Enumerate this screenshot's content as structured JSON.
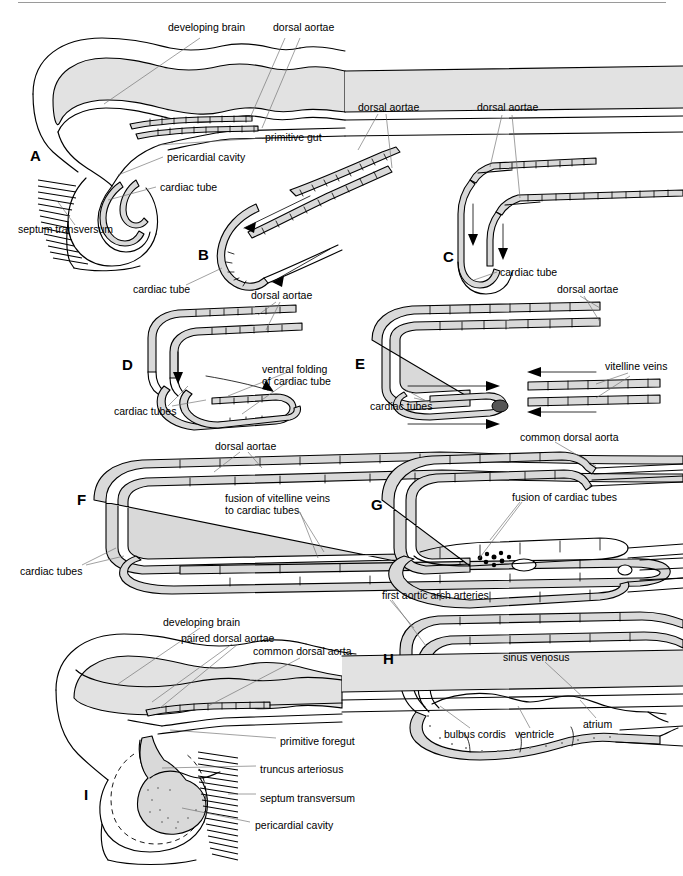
{
  "figure": {
    "width": 683,
    "height": 876,
    "background": "#ffffff",
    "ink_color": "#000000",
    "fill_gray": "#e2e2e2",
    "leader_color": "#6d6d6d"
  },
  "panels": [
    {
      "id": "A",
      "letter": "A",
      "letter_pos": {
        "x": 30,
        "y": 148
      },
      "labels": [
        {
          "name": "developing-brain",
          "text": "developing brain",
          "x": 168,
          "y": 27
        },
        {
          "name": "dorsal-aortae",
          "text": "dorsal aortae",
          "x": 273,
          "y": 27
        },
        {
          "name": "primitive-gut",
          "text": "primitive gut",
          "x": 265,
          "y": 136
        },
        {
          "name": "pericardial-cavity",
          "text": "pericardial cavity",
          "x": 167,
          "y": 156
        },
        {
          "name": "cardiac-tube",
          "text": "cardiac tube",
          "x": 160,
          "y": 185
        },
        {
          "name": "septum-transversum",
          "text": "septum transversum",
          "x": 18,
          "y": 228
        }
      ]
    },
    {
      "id": "B",
      "letter": "B",
      "letter_pos": {
        "x": 198,
        "y": 247
      },
      "labels": [
        {
          "name": "dorsal-aortae",
          "text": "dorsal aortae",
          "x": 358,
          "y": 106
        },
        {
          "name": "cardiac-tube",
          "text": "cardiac tube",
          "x": 133,
          "y": 288
        }
      ]
    },
    {
      "id": "C",
      "letter": "C",
      "letter_pos": {
        "x": 443,
        "y": 249
      },
      "labels": [
        {
          "name": "dorsal-aortae",
          "text": "dorsal aortae",
          "x": 477,
          "y": 107
        },
        {
          "name": "cardiac-tube",
          "text": "cardiac tube",
          "x": 500,
          "y": 271
        }
      ]
    },
    {
      "id": "D",
      "letter": "D",
      "letter_pos": {
        "x": 122,
        "y": 357
      },
      "labels": [
        {
          "name": "dorsal-aortae",
          "text": "dorsal aortae",
          "x": 251,
          "y": 294
        },
        {
          "name": "ventral-folding-of-cardiac-tube",
          "text": "ventral folding\nof cardiac tube",
          "x": 262,
          "y": 368
        },
        {
          "name": "cardiac-tubes",
          "text": "cardiac tubes",
          "x": 114,
          "y": 410
        }
      ]
    },
    {
      "id": "E",
      "letter": "E",
      "letter_pos": {
        "x": 355,
        "y": 356
      },
      "labels": [
        {
          "name": "dorsal-aortae",
          "text": "dorsal aortae",
          "x": 557,
          "y": 288
        },
        {
          "name": "vitelline-veins",
          "text": "vitelline veins",
          "x": 605,
          "y": 365
        },
        {
          "name": "cardiac-tubes",
          "text": "cardiac tubes",
          "x": 370,
          "y": 405
        }
      ]
    },
    {
      "id": "F",
      "letter": "F",
      "letter_pos": {
        "x": 77,
        "y": 492
      },
      "labels": [
        {
          "name": "dorsal-aortae",
          "text": "dorsal aortae",
          "x": 215,
          "y": 445
        },
        {
          "name": "fusion-of-vitelline-veins",
          "text": "fusion of vitelline veins\nto cardiac tubes",
          "x": 225,
          "y": 497
        },
        {
          "name": "cardiac-tubes",
          "text": "cardiac tubes",
          "x": 20,
          "y": 570
        }
      ]
    },
    {
      "id": "G",
      "letter": "G",
      "letter_pos": {
        "x": 371,
        "y": 497
      },
      "labels": [
        {
          "name": "common-dorsal-aorta",
          "text": "common dorsal aorta",
          "x": 520,
          "y": 436
        },
        {
          "name": "fusion-of-cardiac-tubes",
          "text": "fusion of cardiac tubes",
          "x": 512,
          "y": 496
        }
      ]
    },
    {
      "id": "H",
      "letter": "H",
      "letter_pos": {
        "x": 383,
        "y": 651
      },
      "labels": [
        {
          "name": "first-aortic-arch-arteries",
          "text": "first aortic arch arteries",
          "x": 382,
          "y": 594
        },
        {
          "name": "sinus-venosus",
          "text": "sinus venosus",
          "x": 503,
          "y": 656
        },
        {
          "name": "atrium",
          "text": "atrium",
          "x": 583,
          "y": 723
        },
        {
          "name": "ventricle",
          "text": "ventricle",
          "x": 515,
          "y": 733
        },
        {
          "name": "bulbus-cordis",
          "text": "bulbus cordis",
          "x": 444,
          "y": 733
        }
      ]
    },
    {
      "id": "I",
      "letter": "I",
      "letter_pos": {
        "x": 84,
        "y": 787
      },
      "labels": [
        {
          "name": "developing-brain",
          "text": "developing brain",
          "x": 163,
          "y": 621
        },
        {
          "name": "paired-dorsal-aortae",
          "text": "paired dorsal aortae",
          "x": 181,
          "y": 637
        },
        {
          "name": "common-dorsal-aorta",
          "text": "common dorsal aorta",
          "x": 253,
          "y": 650
        },
        {
          "name": "primitive-foregut",
          "text": "primitive foregut",
          "x": 280,
          "y": 740
        },
        {
          "name": "truncus-arteriosus",
          "text": "truncus arteriosus",
          "x": 260,
          "y": 768
        },
        {
          "name": "septum-transversum",
          "text": "septum transversum",
          "x": 260,
          "y": 797
        },
        {
          "name": "pericardial-cavity",
          "text": "pericardial cavity",
          "x": 255,
          "y": 824
        }
      ]
    }
  ]
}
